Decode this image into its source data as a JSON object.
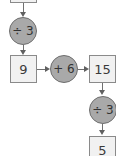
{
  "diagram": {
    "type": "operation-flowchart",
    "nodes": [
      {
        "id": "box_top",
        "kind": "box",
        "value": ""
      },
      {
        "id": "op1",
        "kind": "operation",
        "value": "÷ 3"
      },
      {
        "id": "box_9",
        "kind": "box",
        "value": "9"
      },
      {
        "id": "op2",
        "kind": "operation",
        "value": "+ 6"
      },
      {
        "id": "box_15",
        "kind": "box",
        "value": "15"
      },
      {
        "id": "op3",
        "kind": "operation",
        "value": "÷ 3"
      },
      {
        "id": "box_5",
        "kind": "box",
        "value": "5"
      }
    ],
    "edges": [
      [
        "box_top",
        "op1"
      ],
      [
        "op1",
        "box_9"
      ],
      [
        "box_9",
        "op2"
      ],
      [
        "op2",
        "box_15"
      ],
      [
        "box_15",
        "op3"
      ],
      [
        "op3",
        "box_5"
      ]
    ],
    "colors": {
      "box_fill": "#f1f1f1",
      "box_border": "#8a8a8a",
      "circle_fill": "#a9a9a9",
      "arrow": "#606060",
      "text": "#333333"
    }
  }
}
